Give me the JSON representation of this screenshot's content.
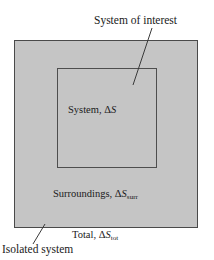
{
  "diagram": {
    "colors": {
      "surroundings_fill": "#c5c5c5",
      "outer_border": "#4a4a4a",
      "inner_border": "#4e4e4e",
      "text": "#1a1a1a",
      "leader_line": "#3a3a3a",
      "background": "#ffffff"
    },
    "labels": {
      "system_of_interest": "System of interest",
      "system_prefix": "System, ",
      "system_delta": "Δ",
      "system_symbol": "S",
      "surroundings_prefix": "Surroundings, ",
      "surroundings_delta": "Δ",
      "surroundings_symbol": "S",
      "surroundings_subscript": "surr",
      "total_prefix": "Total, ",
      "total_delta": "Δ",
      "total_symbol": "S",
      "total_subscript": "tot",
      "isolated_system": "Isolated system"
    },
    "regions": {
      "outer": {
        "name": "Isolated system / surroundings boundary",
        "x": 14,
        "y": 40,
        "width": 184,
        "height": 188
      },
      "inner": {
        "name": "System of interest boundary",
        "x": 57,
        "y": 68,
        "width": 100,
        "height": 100
      }
    },
    "leaders": [
      {
        "name": "system-of-interest-leader",
        "x1": 152,
        "y1": 28,
        "x2": 133,
        "y2": 85
      },
      {
        "name": "isolated-system-leader",
        "x1": 45,
        "y1": 224,
        "x2": 33,
        "y2": 244
      }
    ]
  }
}
